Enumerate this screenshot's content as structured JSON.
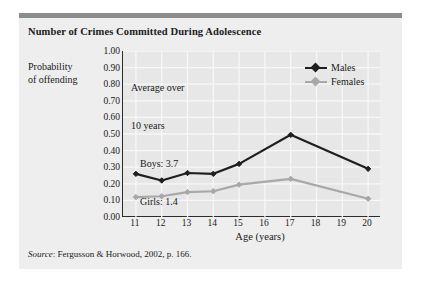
{
  "figure": {
    "title": "Number of Crimes Committed During Adolescence",
    "source_prefix": "Source",
    "source_text": ": Fergusson & Horwood, 2002, p. 166.",
    "card_bg": "#eeeeee",
    "rule_color": "#8c8c8c",
    "plot_bg": "#e7e7e7",
    "axis_color": "#2b2b2b",
    "grid_color": "#f7f7f7"
  },
  "annotation": {
    "line1": "Average over",
    "line2": "10 years",
    "line3": "Boys: 3.7",
    "line4": "Girls: 1.4"
  },
  "legend": {
    "items": [
      {
        "label": "Males",
        "color": "#1f1f1f"
      },
      {
        "label": "Females",
        "color": "#a8a8a8"
      }
    ]
  },
  "axes": {
    "ylabel_line1": "Probability",
    "ylabel_line2": "of offending",
    "xlabel": "Age (years)",
    "yticks": [
      "1.00",
      "0.90",
      "0.80",
      "0.70",
      "0.60",
      "0.50",
      "0.40",
      "0.30",
      "0.20",
      "0.10",
      "0.00"
    ],
    "xticks": [
      "11",
      "12",
      "13",
      "14",
      "15",
      "16",
      "17",
      "18",
      "19",
      "20"
    ]
  },
  "chart_data": {
    "type": "line",
    "title": "Number of Crimes Committed During Adolescence",
    "xlabel": "Age (years)",
    "ylabel": "Probability of offending",
    "x": [
      11,
      12,
      13,
      14,
      15,
      17,
      20
    ],
    "categories": [
      "11",
      "12",
      "13",
      "14",
      "15",
      "16",
      "17",
      "18",
      "19",
      "20"
    ],
    "xlim": [
      10.5,
      20.5
    ],
    "ylim": [
      0.0,
      1.0
    ],
    "ytick_step": 0.1,
    "grid": true,
    "legend_position": "top-right",
    "annotations": [
      "Average over 10 years",
      "Boys: 3.7",
      "Girls: 1.4"
    ],
    "series": [
      {
        "name": "Males",
        "color": "#1f1f1f",
        "marker": "diamond",
        "x": [
          11,
          12,
          13,
          14,
          15,
          17,
          20
        ],
        "values": [
          0.26,
          0.22,
          0.265,
          0.26,
          0.32,
          0.495,
          0.29
        ]
      },
      {
        "name": "Females",
        "color": "#a8a8a8",
        "marker": "diamond",
        "x": [
          11,
          12,
          13,
          14,
          15,
          17,
          20
        ],
        "values": [
          0.12,
          0.125,
          0.15,
          0.155,
          0.195,
          0.23,
          0.11
        ]
      }
    ],
    "source": "Fergusson & Horwood, 2002, p. 166."
  }
}
